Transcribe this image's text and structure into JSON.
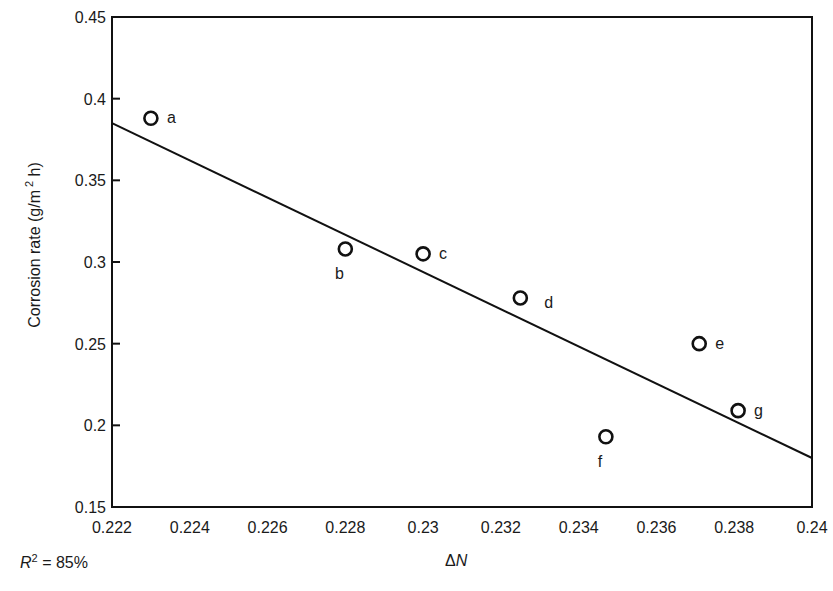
{
  "chart_data": {
    "type": "scatter",
    "title": "",
    "xlabel": "ΔN",
    "ylabel": "Corrosion rate (g/m² h)",
    "ylabel_parts": {
      "prefix": "Corrosion rate (g/m",
      "sup": "2",
      "suffix": " h)"
    },
    "xlim": [
      0.222,
      0.24
    ],
    "ylim": [
      0.15,
      0.45
    ],
    "grid": false,
    "legend": null,
    "xticks": [
      "0.222",
      "0.224",
      "0.226",
      "0.228",
      "0.23",
      "0.232",
      "0.234",
      "0.236",
      "0.238",
      "0.24"
    ],
    "xtick_values": [
      0.222,
      0.224,
      0.226,
      0.228,
      0.23,
      0.232,
      0.234,
      0.236,
      0.238,
      0.24
    ],
    "yticks": [
      "0.15",
      "0.2",
      "0.25",
      "0.3",
      "0.35",
      "0.4",
      "0.45"
    ],
    "ytick_values": [
      0.15,
      0.2,
      0.25,
      0.3,
      0.35,
      0.4,
      0.45
    ],
    "points": [
      {
        "label": "a",
        "x": 0.223,
        "y": 0.388,
        "label_pos": "right"
      },
      {
        "label": "b",
        "x": 0.228,
        "y": 0.308,
        "label_pos": "below-left"
      },
      {
        "label": "c",
        "x": 0.23,
        "y": 0.305,
        "label_pos": "right"
      },
      {
        "label": "d",
        "x": 0.2325,
        "y": 0.278,
        "label_pos": "right-low"
      },
      {
        "label": "e",
        "x": 0.2371,
        "y": 0.25,
        "label_pos": "right"
      },
      {
        "label": "f",
        "x": 0.2347,
        "y": 0.193,
        "label_pos": "below-left"
      },
      {
        "label": "g",
        "x": 0.2381,
        "y": 0.209,
        "label_pos": "right"
      }
    ],
    "fit_line": {
      "x": [
        0.222,
        0.24
      ],
      "y": [
        0.385,
        0.18
      ]
    },
    "annotations": [
      {
        "text": "R² = 85%",
        "position": "bottom-left"
      }
    ]
  },
  "annotation": {
    "r_symbol": "R",
    "r_sup": "2",
    "r_value": " = 85%"
  },
  "xlabel": {
    "delta": "Δ",
    "var": "N"
  }
}
